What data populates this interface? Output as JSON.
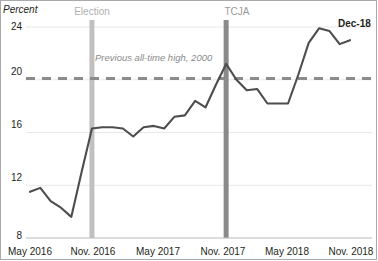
{
  "chart_data": {
    "type": "line",
    "title": "",
    "ylabel": "Percent",
    "xlabel": "",
    "ylim": [
      8,
      24
    ],
    "yticks": [
      8,
      12,
      16,
      20,
      24
    ],
    "ytick_labels": [
      "8",
      "12",
      "16",
      "20",
      "24"
    ],
    "grid": true,
    "legend": "none",
    "x": [
      "May 2016",
      "Jun 2016",
      "Jul 2016",
      "Aug 2016",
      "Sep 2016",
      "Oct 2016",
      "Nov 2016",
      "Dec 2016",
      "Jan 2017",
      "Feb 2017",
      "Mar 2017",
      "Apr 2017",
      "May 2017",
      "Jun 2017",
      "Jul 2017",
      "Aug 2017",
      "Sep 2017",
      "Oct 2017",
      "Nov 2017",
      "Dec 2017",
      "Jan 2018",
      "Feb 2018",
      "Mar 2018",
      "Apr 2018",
      "May 2018",
      "Jun 2018",
      "Jul 2018",
      "Aug 2018",
      "Sep 2018",
      "Oct 2018",
      "Nov 2018",
      "Dec 2018"
    ],
    "xtick_labels": [
      "May 2016",
      "Nov. 2016",
      "May 2017",
      "Nov. 2017",
      "May 2018",
      "Nov. 2018"
    ],
    "xtick_positions": [
      0,
      6,
      12,
      18,
      24,
      30
    ],
    "series": [
      {
        "name": "Percent",
        "color": "#4d4d4d",
        "values": [
          11.5,
          11.8,
          10.8,
          10.3,
          9.6,
          13.0,
          16.3,
          16.4,
          16.4,
          16.3,
          15.7,
          16.4,
          16.5,
          16.3,
          17.2,
          17.3,
          18.4,
          17.9,
          19.6,
          21.2,
          20.0,
          19.2,
          19.3,
          18.2,
          18.2,
          18.2,
          20.4,
          22.8,
          23.9,
          23.7,
          22.7,
          23.0
        ]
      }
    ],
    "reference_line": {
      "label": "Previous all-time high, 2000",
      "value": 20.1,
      "style": "dashed",
      "color": "#8b8b8b"
    },
    "vertical_markers": [
      {
        "label": "Election",
        "x_index": 6,
        "color": "#c0c0c0"
      },
      {
        "label": "TCJA",
        "x_index": 19,
        "color": "#8a8a8a"
      }
    ],
    "annotations": [
      {
        "label": "Dec-18",
        "x_index": 31,
        "bold": true
      }
    ]
  }
}
